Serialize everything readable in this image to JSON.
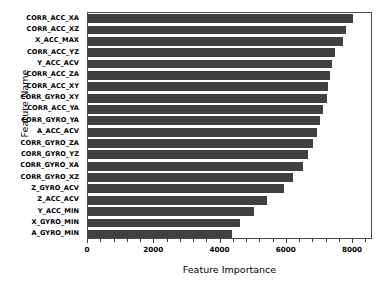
{
  "chart_data": {
    "type": "bar",
    "orientation": "horizontal",
    "title": "",
    "xlabel": "Feature Importance",
    "ylabel": "Feature Name",
    "xlim": [
      0,
      8600
    ],
    "xticks": [
      0,
      2000,
      4000,
      6000,
      8000
    ],
    "xticklabels": [
      "0",
      "2000",
      "4000",
      "6000",
      "8000"
    ],
    "minor_tick_step": 400,
    "grid": false,
    "legend": null,
    "bar_color": "#404040",
    "categories": [
      "CORR_ACC_XA",
      "CORR_ACC_XZ",
      "X_ACC_MAX",
      "CORR_ACC_YZ",
      "Y_ACC_ACV",
      "CORR_ACC_ZA",
      "CORR_ACC_XY",
      "CORR_GYRO_XY",
      "CORR_ACC_YA",
      "CORR_GYRO_YA",
      "A_ACC_ACV",
      "CORR_GYRO_ZA",
      "CORR_GYRO_YZ",
      "CORR_GYRO_XA",
      "CORR_GYRO_XZ",
      "Z_GYRO_ACV",
      "Z_ACC_ACV",
      "Y_ACC_MIN",
      "X_GYRO_MIN",
      "A_GYRO_MIN"
    ],
    "values": [
      8000,
      7800,
      7700,
      7450,
      7350,
      7300,
      7250,
      7200,
      7100,
      7000,
      6900,
      6800,
      6650,
      6500,
      6200,
      5900,
      5400,
      5000,
      4600,
      4350
    ]
  }
}
